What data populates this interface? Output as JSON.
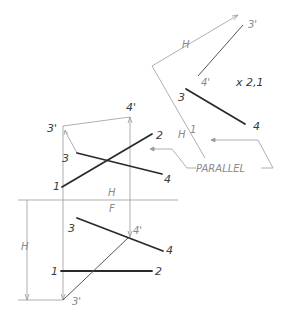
{
  "drawing": {
    "type": "orthographic-projection-auxiliary-view",
    "fold_lines": {
      "main_top": "H",
      "main_bottom": "F",
      "aux_top": "H",
      "aux_bottom": "1"
    },
    "labels": {
      "top_view": {
        "p3prime": "3'",
        "p4prime": "4'",
        "p3": "3",
        "p4": "4",
        "p1": "1",
        "p2": "2"
      },
      "front_view": {
        "p3": "3",
        "p4": "4",
        "p4prime": "4'",
        "p1": "1",
        "p2": "2",
        "p3prime": "3'"
      },
      "aux_view": {
        "p3prime": "3'",
        "p4prime": "4'",
        "p3": "3",
        "p4": "4",
        "point_view": "x 2,1"
      },
      "dimension_H_left": "H",
      "dimension_H_aux": "H",
      "parallel_note": "PARALLEL"
    },
    "colors": {
      "object_line": "#2a2a2a",
      "construction_line": "#9a9a9a",
      "background": "#ffffff"
    }
  }
}
